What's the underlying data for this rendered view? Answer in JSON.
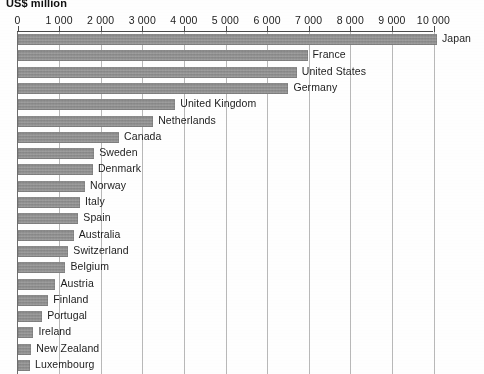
{
  "chart_data": {
    "type": "bar",
    "orientation": "horizontal",
    "title": "US$ million",
    "xlabel": "",
    "ylabel": "",
    "xlim": [
      0,
      10000
    ],
    "grid": true,
    "legend": "none",
    "tick_labels": [
      "0",
      "1 000",
      "2 000",
      "3 000",
      "4 000",
      "5 000",
      "6 000",
      "7 000",
      "8 000",
      "9 000",
      "10 000"
    ],
    "ticks": [
      0,
      1000,
      2000,
      3000,
      4000,
      5000,
      6000,
      7000,
      8000,
      9000,
      10000
    ],
    "categories": [
      "Japan",
      "France",
      "United States",
      "Germany",
      "United Kingdom",
      "Netherlands",
      "Canada",
      "Sweden",
      "Denmark",
      "Norway",
      "Italy",
      "Spain",
      "Australia",
      "Switzerland",
      "Belgium",
      "Austria",
      "Finland",
      "Portugal",
      "Ireland",
      "New Zealand",
      "Luxembourg"
    ],
    "values": [
      10070,
      6960,
      6700,
      6500,
      3780,
      3250,
      2430,
      1830,
      1800,
      1610,
      1490,
      1450,
      1340,
      1210,
      1140,
      900,
      730,
      580,
      370,
      320,
      290
    ],
    "bar_color": "#909090",
    "gridline_color": "#b9b9b9",
    "axis_color": "#4a4a4a"
  }
}
